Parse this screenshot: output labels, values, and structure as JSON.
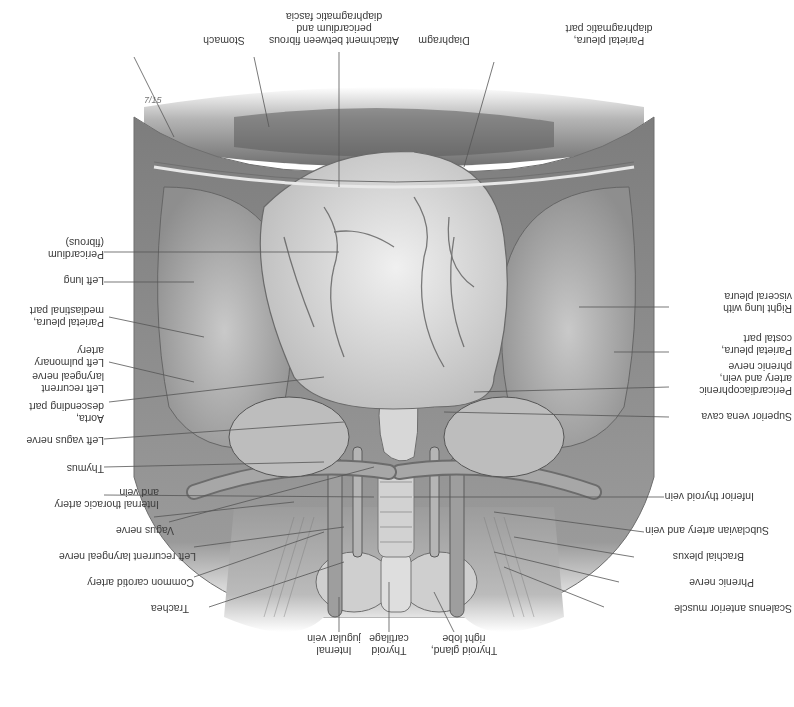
{
  "figure": {
    "orientation": "rotated 180 degrees",
    "style": "grayscale anatomical illustration",
    "signature": "7/15"
  },
  "labels_right_side_upright": [
    {
      "id": "parietal-pleura-diaphragmatic",
      "text": "Parietal pleura,\ndiaphragmatic part"
    },
    {
      "id": "diaphragm",
      "text": "Diaphragm"
    },
    {
      "id": "attachment",
      "text": "Attachment between fibrous\npericardium and\ndiaphragmatic fascia"
    },
    {
      "id": "stomach",
      "text": "Stomach"
    }
  ],
  "labels": {
    "parietal_pleura_diaphragmatic": "Parietal pleura,\ndiaphragmatic part",
    "diaphragm": "Diaphragm",
    "attachment": "Attachment between fibrous\npericardium and\ndiaphragmatic fascia",
    "stomach": "Stomach",
    "pericardium": "Pericardium\n(fibrous)",
    "left_lung": "Left lung",
    "parietal_pleura_mediastinal": "Parietal pleura,\nmediastinal part",
    "left_pulmonary_artery": "Left pulmonary\nartery",
    "left_recurrent_laryngeal_1": "Left recurrent\nlaryngeal nerve",
    "aorta_descending": "Aorta,\ndescending part",
    "left_vagus": "Left vagus nerve",
    "thymus": "Thymus",
    "internal_thoracic": "Internal thoracic artery\nand vein",
    "vagus": "Vagus nerve",
    "left_recurrent_laryngeal_2": "Left recurrent laryngeal nerve",
    "common_carotid": "Common carotid artery",
    "trachea": "Trachea",
    "internal_jugular": "Internal\njugular vein",
    "thyroid_cartilage": "Thyroid\ncartilage",
    "thyroid_gland_right": "Thyroid gland,\nright lobe",
    "scalenus_anterior": "Scalenus anterior muscle",
    "phrenic_nerve": "Phrenic nerve",
    "brachial_plexus": "Brachial plexus",
    "subclavian": "Subclavian artery and vein",
    "inferior_thyroid_vein": "Inferior thyroid vein",
    "superior_vena_cava": "Superior vena cava",
    "pericardiacophrenic": "Pericardiacophrenic\nartery and vein,\nphrenic nerve",
    "parietal_pleura_costal": "Parietal pleura,\ncostal part",
    "right_lung": "Right lung with\nvisceral pleura"
  },
  "colors": {
    "background": "#ffffff",
    "label_text": "#3a3a3a",
    "leader_line": "#555555",
    "tissue_light": "#d9d9d9",
    "tissue_mid": "#a8a8a8",
    "tissue_dark": "#5a5a5a"
  }
}
